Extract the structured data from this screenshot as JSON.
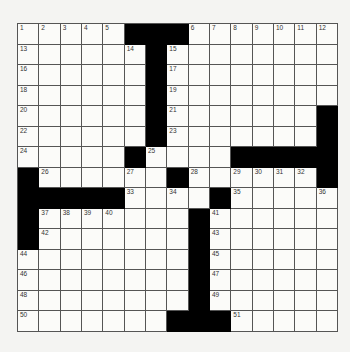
{
  "puzzle": {
    "rows": 15,
    "cols": 15,
    "colors": {
      "block": "#000000",
      "cell": "#fbfbf9",
      "grid_line": "#555555",
      "background": "#f4f4f2"
    },
    "layout": [
      ".....###.......",
      "......#........",
      "......#........",
      "......#........",
      "......#.......#",
      "......#.......#",
      ".....#....#####",
      "#......#......#",
      "#####....#.....",
      "#.......#......",
      "#.......#......",
      "........#......",
      "........#......",
      "........#......",
      ".......###....."
    ],
    "numbers": [
      {
        "r": 0,
        "c": 0,
        "n": "1"
      },
      {
        "r": 0,
        "c": 1,
        "n": "2"
      },
      {
        "r": 0,
        "c": 2,
        "n": "3"
      },
      {
        "r": 0,
        "c": 3,
        "n": "4"
      },
      {
        "r": 0,
        "c": 4,
        "n": "5"
      },
      {
        "r": 0,
        "c": 8,
        "n": "6"
      },
      {
        "r": 0,
        "c": 9,
        "n": "7"
      },
      {
        "r": 0,
        "c": 10,
        "n": "8"
      },
      {
        "r": 0,
        "c": 11,
        "n": "9"
      },
      {
        "r": 0,
        "c": 12,
        "n": "10"
      },
      {
        "r": 0,
        "c": 13,
        "n": "11"
      },
      {
        "r": 0,
        "c": 14,
        "n": "12"
      },
      {
        "r": 1,
        "c": 0,
        "n": "13"
      },
      {
        "r": 1,
        "c": 5,
        "n": "14"
      },
      {
        "r": 1,
        "c": 7,
        "n": "15"
      },
      {
        "r": 2,
        "c": 0,
        "n": "16"
      },
      {
        "r": 2,
        "c": 7,
        "n": "17"
      },
      {
        "r": 3,
        "c": 0,
        "n": "18"
      },
      {
        "r": 3,
        "c": 7,
        "n": "19"
      },
      {
        "r": 4,
        "c": 0,
        "n": "20"
      },
      {
        "r": 4,
        "c": 7,
        "n": "21"
      },
      {
        "r": 5,
        "c": 0,
        "n": "22"
      },
      {
        "r": 5,
        "c": 7,
        "n": "23"
      },
      {
        "r": 6,
        "c": 0,
        "n": "24"
      },
      {
        "r": 6,
        "c": 6,
        "n": "25"
      },
      {
        "r": 7,
        "c": 1,
        "n": "26"
      },
      {
        "r": 7,
        "c": 5,
        "n": "27"
      },
      {
        "r": 7,
        "c": 8,
        "n": "28"
      },
      {
        "r": 7,
        "c": 10,
        "n": "29"
      },
      {
        "r": 7,
        "c": 11,
        "n": "30"
      },
      {
        "r": 7,
        "c": 12,
        "n": "31"
      },
      {
        "r": 7,
        "c": 13,
        "n": "32"
      },
      {
        "r": 8,
        "c": 5,
        "n": "33"
      },
      {
        "r": 8,
        "c": 7,
        "n": "34"
      },
      {
        "r": 8,
        "c": 10,
        "n": "35"
      },
      {
        "r": 8,
        "c": 14,
        "n": "36"
      },
      {
        "r": 9,
        "c": 1,
        "n": "37"
      },
      {
        "r": 9,
        "c": 2,
        "n": "38"
      },
      {
        "r": 9,
        "c": 3,
        "n": "39"
      },
      {
        "r": 9,
        "c": 4,
        "n": "40"
      },
      {
        "r": 9,
        "c": 9,
        "n": "41"
      },
      {
        "r": 10,
        "c": 1,
        "n": "42"
      },
      {
        "r": 10,
        "c": 9,
        "n": "43"
      },
      {
        "r": 11,
        "c": 0,
        "n": "44"
      },
      {
        "r": 11,
        "c": 9,
        "n": "45"
      },
      {
        "r": 12,
        "c": 0,
        "n": "46"
      },
      {
        "r": 12,
        "c": 9,
        "n": "47"
      },
      {
        "r": 13,
        "c": 0,
        "n": "48"
      },
      {
        "r": 13,
        "c": 9,
        "n": "49"
      },
      {
        "r": 14,
        "c": 0,
        "n": "50"
      },
      {
        "r": 14,
        "c": 10,
        "n": "51"
      }
    ]
  }
}
